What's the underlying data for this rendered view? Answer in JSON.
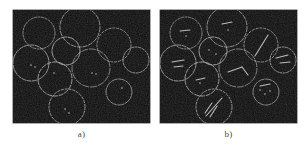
{
  "figure": {
    "background_color": "#ffffff",
    "panel_background_color": "#0c0c0c",
    "circle_stroke_color": "#b4b4b4",
    "feature_color": "#d8d8d8",
    "caption_color": "#4a4a4a",
    "panel_width": 137,
    "panel_height": 113,
    "panels": [
      {
        "id": "panel-a",
        "caption": "a)",
        "x": 13,
        "y": 10,
        "caption_y": 130,
        "circles": [
          {
            "cx": 26,
            "cy": 23,
            "r": 16
          },
          {
            "cx": 67,
            "cy": 17,
            "r": 20
          },
          {
            "cx": 53,
            "cy": 41,
            "r": 14
          },
          {
            "cx": 101,
            "cy": 35,
            "r": 17
          },
          {
            "cx": 18,
            "cy": 53,
            "r": 18
          },
          {
            "cx": 78,
            "cy": 58,
            "r": 19
          },
          {
            "cx": 123,
            "cy": 50,
            "r": 13
          },
          {
            "cx": 42,
            "cy": 69,
            "r": 17
          },
          {
            "cx": 106,
            "cy": 82,
            "r": 13
          },
          {
            "cx": 54,
            "cy": 97,
            "r": 18
          }
        ],
        "features": [
          {
            "type": "dot",
            "cx": 18,
            "cy": 55
          },
          {
            "type": "dot",
            "cx": 22,
            "cy": 57
          },
          {
            "type": "dot",
            "cx": 79,
            "cy": 63
          },
          {
            "type": "dot",
            "cx": 83,
            "cy": 64
          },
          {
            "type": "dot",
            "cx": 41,
            "cy": 63
          },
          {
            "type": "dot",
            "cx": 109,
            "cy": 78
          },
          {
            "type": "dot",
            "cx": 52,
            "cy": 99
          },
          {
            "type": "dot",
            "cx": 56,
            "cy": 103
          }
        ]
      },
      {
        "id": "panel-b",
        "caption": "b)",
        "x": 160,
        "y": 10,
        "caption_y": 130,
        "circles": [
          {
            "cx": 26,
            "cy": 23,
            "r": 16
          },
          {
            "cx": 67,
            "cy": 17,
            "r": 20
          },
          {
            "cx": 53,
            "cy": 41,
            "r": 14
          },
          {
            "cx": 101,
            "cy": 35,
            "r": 17
          },
          {
            "cx": 18,
            "cy": 53,
            "r": 18
          },
          {
            "cx": 78,
            "cy": 58,
            "r": 19
          },
          {
            "cx": 123,
            "cy": 50,
            "r": 13
          },
          {
            "cx": 42,
            "cy": 69,
            "r": 17
          },
          {
            "cx": 106,
            "cy": 82,
            "r": 13
          },
          {
            "cx": 54,
            "cy": 97,
            "r": 18
          }
        ],
        "features": [
          {
            "type": "streak",
            "x1": 95,
            "y1": 46,
            "x2": 108,
            "y2": 25
          },
          {
            "type": "streak",
            "x1": 46,
            "y1": 106,
            "x2": 62,
            "y2": 88
          },
          {
            "type": "streak",
            "x1": 45,
            "y1": 103,
            "x2": 52,
            "y2": 93
          },
          {
            "type": "streak",
            "x1": 50,
            "y1": 107,
            "x2": 57,
            "y2": 96
          },
          {
            "type": "streak",
            "x1": 68,
            "y1": 62,
            "x2": 82,
            "y2": 57
          },
          {
            "type": "streak",
            "x1": 82,
            "y1": 57,
            "x2": 88,
            "y2": 65
          },
          {
            "type": "streak",
            "x1": 116,
            "y1": 48,
            "x2": 128,
            "y2": 45
          },
          {
            "type": "streak",
            "x1": 120,
            "y1": 53,
            "x2": 130,
            "y2": 52
          },
          {
            "type": "streak",
            "x1": 12,
            "y1": 52,
            "x2": 24,
            "y2": 50
          },
          {
            "type": "streak",
            "x1": 14,
            "y1": 57,
            "x2": 23,
            "y2": 56
          },
          {
            "type": "streak",
            "x1": 20,
            "y1": 21,
            "x2": 30,
            "y2": 20
          },
          {
            "type": "streak",
            "x1": 62,
            "y1": 14,
            "x2": 72,
            "y2": 12
          },
          {
            "type": "streak",
            "x1": 36,
            "y1": 70,
            "x2": 45,
            "y2": 68
          },
          {
            "type": "streak",
            "x1": 100,
            "y1": 76,
            "x2": 110,
            "y2": 74
          },
          {
            "type": "dot",
            "cx": 100,
            "cy": 80
          },
          {
            "type": "dot",
            "cx": 105,
            "cy": 84
          },
          {
            "type": "dot",
            "cx": 110,
            "cy": 81
          },
          {
            "type": "dot",
            "cx": 40,
            "cy": 73
          },
          {
            "type": "dot",
            "cx": 49,
            "cy": 40
          },
          {
            "type": "dot",
            "cx": 56,
            "cy": 44
          },
          {
            "type": "dot",
            "cx": 68,
            "cy": 20
          },
          {
            "type": "dot",
            "cx": 26,
            "cy": 26
          }
        ]
      }
    ]
  }
}
